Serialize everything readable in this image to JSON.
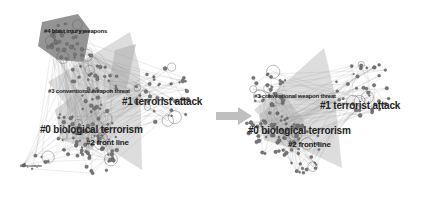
{
  "figure": {
    "left_panel": {
      "name": "cluster-network-before",
      "clusters": [
        {
          "id": "#0",
          "label": "#0 biological terrorism"
        },
        {
          "id": "#1",
          "label": "#1 terrorist attack"
        },
        {
          "id": "#2",
          "label": "#2 front line"
        },
        {
          "id": "#3",
          "label": "#3 conventional weapon threat"
        },
        {
          "id": "#4",
          "label": "#4 blast injury weapons"
        }
      ],
      "small_labels": [
        "#6 ring contagion"
      ]
    },
    "arrow": {
      "icon": "right-arrow-icon",
      "color": "#bfbfbf"
    },
    "right_panel": {
      "name": "cluster-network-after",
      "clusters": [
        {
          "id": "#0",
          "label": "#0 biological terrorism"
        },
        {
          "id": "#1",
          "label": "#1 terrorist attack"
        },
        {
          "id": "#2",
          "label": "#2 front line"
        },
        {
          "id": "#3",
          "label": "#3 conventional weapon threat"
        }
      ]
    },
    "colors": {
      "hull_fill": "#c8c8c8",
      "dark_hull_fill": "#6e6e6e",
      "node_stroke": "#555555",
      "edge": "#9a9a9a",
      "label": "#222222"
    }
  }
}
